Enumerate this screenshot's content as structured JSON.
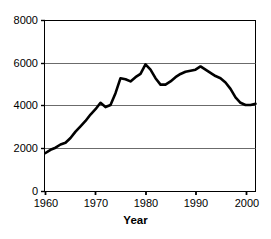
{
  "chart_data": {
    "type": "line",
    "title": "",
    "subtitle": "",
    "xlabel": "Year",
    "ylabel": "",
    "xlim": [
      1960,
      2002
    ],
    "ylim": [
      0,
      8000
    ],
    "grid": true,
    "gridlines_y": [
      2000,
      4000,
      6000,
      8000
    ],
    "legend": null,
    "legend_position": "none",
    "xticks": [
      1960,
      1970,
      1980,
      1990,
      2000
    ],
    "xtick_labels": [
      "1960",
      "1970",
      "1980",
      "1990",
      "2000"
    ],
    "yticks": [
      0,
      2000,
      4000,
      6000,
      8000
    ],
    "ytick_labels": [
      "0",
      "2000",
      "4000",
      "6000",
      "8000"
    ],
    "line_color": "#000000",
    "line_width": 2.6,
    "x": [
      1960,
      1961,
      1962,
      1963,
      1964,
      1965,
      1966,
      1967,
      1968,
      1969,
      1970,
      1971,
      1972,
      1973,
      1974,
      1975,
      1976,
      1977,
      1978,
      1979,
      1980,
      1981,
      1982,
      1983,
      1984,
      1985,
      1986,
      1987,
      1988,
      1989,
      1990,
      1991,
      1992,
      1993,
      1994,
      1995,
      1996,
      1997,
      1998,
      1999,
      2000,
      2001,
      2002
    ],
    "values": [
      1800,
      1950,
      2050,
      2200,
      2280,
      2500,
      2800,
      3050,
      3300,
      3600,
      3850,
      4150,
      3950,
      4050,
      4600,
      5300,
      5250,
      5150,
      5350,
      5500,
      5950,
      5700,
      5300,
      5000,
      5000,
      5150,
      5350,
      5500,
      5600,
      5650,
      5700,
      5850,
      5700,
      5550,
      5400,
      5300,
      5100,
      4800,
      4400,
      4150,
      4050,
      4050,
      4100
    ],
    "annotations": []
  },
  "axis_title": {
    "x": "Year"
  }
}
